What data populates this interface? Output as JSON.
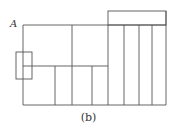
{
  "diagram": {
    "point_label": "A",
    "caption": "(b)",
    "line_color": "#555555"
  }
}
